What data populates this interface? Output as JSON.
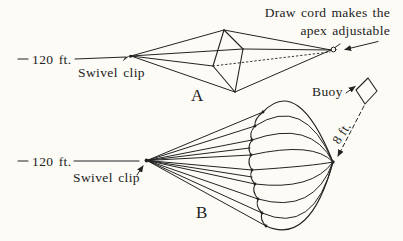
{
  "palette": {
    "paper": "#fcfbf6",
    "ink": "#232323"
  },
  "diagram_a": {
    "label": "A",
    "distance_label": "120 ft.",
    "swivel_label": "Swivel clip",
    "annotation": {
      "line1": "Draw cord makes the",
      "line2": "apex adjustable"
    },
    "buoy_label": "Buoy"
  },
  "diagram_b": {
    "label": "B",
    "distance_label": "120 ft.",
    "swivel_label": "Swivel clip",
    "depth_label": "8 ft."
  }
}
